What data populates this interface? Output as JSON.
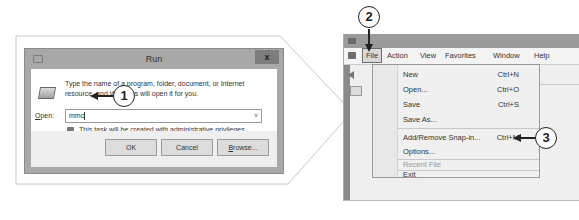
{
  "run_dialog": {
    "title": "Run",
    "close_label": "x",
    "description": "Type the name of a program, folder, document, or Internet resource, and Windows will open it for you.",
    "open_label_underlined": "O",
    "open_label_rest": "pen:",
    "input_value": "mmc",
    "dropdown_glyph": "˅",
    "admin_note": "This task will be created with administrative privileges.",
    "buttons": {
      "ok": "OK",
      "cancel": "Cancel",
      "browse_underlined": "B",
      "browse_rest": "rowse..."
    }
  },
  "steps": {
    "one": "1",
    "two": "2",
    "three": "3"
  },
  "mmc": {
    "menubar": [
      "File",
      "Action",
      "View",
      "Favorites",
      "Window",
      "Help"
    ],
    "file_menu": [
      {
        "label": "New",
        "shortcut": "Ctrl+N"
      },
      {
        "label": "Open...",
        "shortcut": "Ctrl+O"
      },
      {
        "label": "Save",
        "shortcut": "Ctrl+S"
      },
      {
        "label": "Save As...",
        "shortcut": ""
      },
      {
        "label": "Add/Remove Snap-in...",
        "shortcut": "Ctrl+M"
      },
      {
        "label": "Options...",
        "shortcut": ""
      },
      {
        "label": "Recent File",
        "shortcut": ""
      },
      {
        "label": "Exit",
        "shortcut": ""
      }
    ]
  },
  "colors": {
    "frame_gray": "#a8a8a8",
    "callout_border": "#c8c8c8",
    "marker_black": "#222222"
  }
}
